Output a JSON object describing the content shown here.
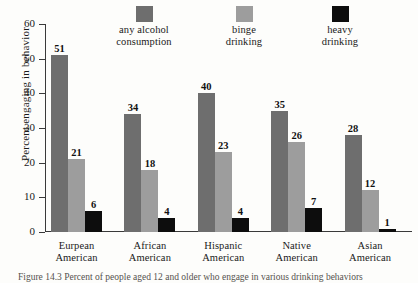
{
  "figure": {
    "caption": "Figure 14.3 Percent of people aged 12 and older who engage in various drinking behaviors"
  },
  "chart_data": {
    "type": "bar",
    "title": "",
    "xlabel": "",
    "ylabel": "Percent engaging in behavior",
    "ylim": [
      0,
      60
    ],
    "yticks": [
      0,
      10,
      20,
      30,
      40,
      50,
      60
    ],
    "ytick_labels": [
      "0",
      "10",
      "20",
      "30",
      "40",
      "50",
      "60"
    ],
    "grid": false,
    "legend_position": "top",
    "categories": [
      "Eurpean American",
      "African American",
      "Hispanic American",
      "Native American",
      "Asian American"
    ],
    "category_lines": [
      [
        "Eurpean",
        "American"
      ],
      [
        "African",
        "American"
      ],
      [
        "Hispanic",
        "American"
      ],
      [
        "Native",
        "American"
      ],
      [
        "Asian",
        "American"
      ]
    ],
    "series": [
      {
        "name": "any alcohol consumption",
        "name_lines": [
          "any alcohol",
          "consumption"
        ],
        "color": "#6e6e6e",
        "values": [
          51,
          34,
          40,
          35,
          28
        ]
      },
      {
        "name": "binge drinking",
        "name_lines": [
          "binge",
          "drinking"
        ],
        "color": "#9d9d9d",
        "values": [
          21,
          18,
          23,
          26,
          12
        ]
      },
      {
        "name": "heavy drinking",
        "name_lines": [
          "heavy",
          "drinking"
        ],
        "color": "#0d0d0d",
        "values": [
          6,
          4,
          4,
          7,
          1
        ]
      }
    ]
  }
}
